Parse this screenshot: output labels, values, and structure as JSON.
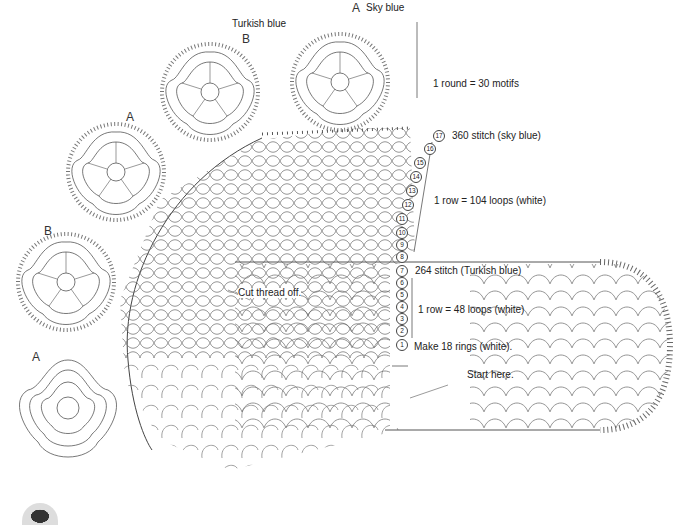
{
  "diagram": {
    "type": "crochet-chart",
    "motifs": [
      {
        "id": "top",
        "letter": "A",
        "color_label": "Sky blue"
      },
      {
        "id": "second",
        "letter": "B",
        "color_label": "Turkish blue"
      },
      {
        "id": "third",
        "letter": "A"
      },
      {
        "id": "fourth",
        "letter": "B"
      },
      {
        "id": "fifth",
        "letter": "A"
      }
    ],
    "annotations": {
      "round_motifs": "1 round = 30 motifs",
      "row17": "360 stitch (sky blue)",
      "rows_8_16": "1 row = 104 loops (white)",
      "row7": "264 stitch (Turkish blue)",
      "rows_2_6": "1 row = 48 loops (white)",
      "row1": "Make 18 rings (white).",
      "cut": "Cut thread off.",
      "start": "Start here."
    },
    "row_numbers_upper": [
      "17",
      "16",
      "15",
      "14",
      "13",
      "12",
      "11",
      "10",
      "9",
      "8"
    ],
    "row_numbers_lower": [
      "7",
      "6",
      "5",
      "4",
      "3",
      "2",
      "1"
    ],
    "colors": {
      "line": "#555555",
      "background": "#ffffff",
      "text": "#222222"
    }
  }
}
